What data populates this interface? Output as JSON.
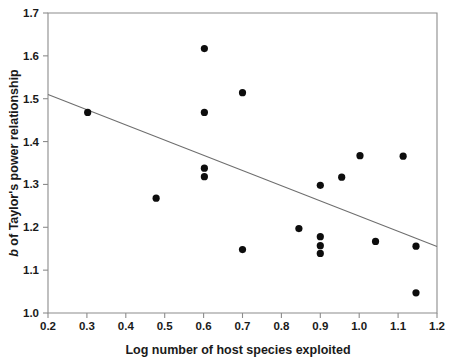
{
  "chart_data": {
    "type": "scatter",
    "title": "",
    "xlabel": "Log number of host species exploited",
    "ylabel": "b of Taylor's power relationship",
    "ylabel_italic_prefix": "b",
    "ylabel_rest": " of Taylor's power relationship",
    "xlim": [
      0.2,
      1.2
    ],
    "ylim": [
      1.0,
      1.7
    ],
    "xticks": [
      0.2,
      0.3,
      0.4,
      0.5,
      0.6,
      0.7,
      0.8,
      0.9,
      1.0,
      1.1,
      1.2
    ],
    "yticks": [
      1.0,
      1.1,
      1.2,
      1.3,
      1.4,
      1.5,
      1.6,
      1.7
    ],
    "xtick_labels": [
      "0.2",
      "0.3",
      "0.4",
      "0.5",
      "0.6",
      "0.7",
      "0.8",
      "0.9",
      "1.0",
      "1.1",
      "1.2"
    ],
    "ytick_labels": [
      "1.0",
      "1.1",
      "1.2",
      "1.3",
      "1.4",
      "1.5",
      "1.6",
      "1.7"
    ],
    "grid": false,
    "legend": null,
    "marker": "filled-circle",
    "marker_color": "#0d0d0d",
    "marker_radius_px": 3.6,
    "frame_color": "#8c8c8c",
    "trendline_color": "#6e6e6e",
    "points": [
      {
        "x": 0.302,
        "y": 1.468
      },
      {
        "x": 0.478,
        "y": 1.268
      },
      {
        "x": 0.602,
        "y": 1.617
      },
      {
        "x": 0.602,
        "y": 1.468
      },
      {
        "x": 0.602,
        "y": 1.338
      },
      {
        "x": 0.602,
        "y": 1.318
      },
      {
        "x": 0.7,
        "y": 1.514
      },
      {
        "x": 0.7,
        "y": 1.148
      },
      {
        "x": 0.845,
        "y": 1.197
      },
      {
        "x": 0.9,
        "y": 1.298
      },
      {
        "x": 0.9,
        "y": 1.178
      },
      {
        "x": 0.9,
        "y": 1.157
      },
      {
        "x": 0.9,
        "y": 1.139
      },
      {
        "x": 0.955,
        "y": 1.317
      },
      {
        "x": 1.002,
        "y": 1.367
      },
      {
        "x": 1.042,
        "y": 1.167
      },
      {
        "x": 1.113,
        "y": 1.366
      },
      {
        "x": 1.146,
        "y": 1.156
      },
      {
        "x": 1.146,
        "y": 1.047
      }
    ],
    "trendline": {
      "x_start": 0.2,
      "y_start": 1.51,
      "x_end": 1.2,
      "y_end": 1.155
    }
  }
}
